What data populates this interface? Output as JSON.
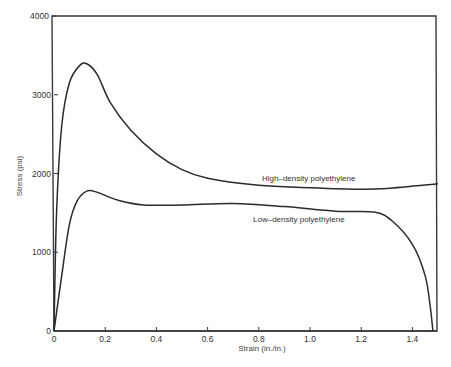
{
  "chart_data": {
    "type": "line",
    "title": "",
    "xlabel": "Strain (in./in.)",
    "ylabel": "Stress (psi)",
    "xlim": [
      0,
      1.5
    ],
    "ylim": [
      0,
      4000
    ],
    "grid": false,
    "legend": "inline annotations",
    "x_ticks": [
      0,
      0.2,
      0.4,
      0.6,
      0.8,
      1.0,
      1.2,
      1.4
    ],
    "x_tick_labels": [
      "0",
      "0.2",
      "0.4",
      "0.6",
      "0.8",
      "1.0",
      "1.2",
      "1.4"
    ],
    "y_ticks": [
      0,
      1000,
      2000,
      3000,
      4000
    ],
    "y_tick_labels": [
      "0",
      "1000",
      "2000",
      "3000",
      "4000"
    ],
    "series": [
      {
        "name": "High–density polyethylene",
        "x": [
          0,
          0.01,
          0.03,
          0.06,
          0.1,
          0.13,
          0.17,
          0.22,
          0.3,
          0.4,
          0.5,
          0.6,
          0.8,
          1.0,
          1.2,
          1.3,
          1.5
        ],
        "y": [
          0,
          1500,
          2600,
          3150,
          3370,
          3390,
          3250,
          2900,
          2550,
          2250,
          2050,
          1940,
          1850,
          1820,
          1800,
          1810,
          1870
        ]
      },
      {
        "name": "Low–density polyethylene",
        "x": [
          0,
          0.03,
          0.06,
          0.09,
          0.13,
          0.17,
          0.25,
          0.35,
          0.5,
          0.7,
          0.9,
          1.1,
          1.25,
          1.32,
          1.4,
          1.45,
          1.47,
          1.48
        ],
        "y": [
          0,
          700,
          1350,
          1650,
          1780,
          1760,
          1660,
          1600,
          1600,
          1620,
          1580,
          1520,
          1510,
          1400,
          1100,
          700,
          300,
          0
        ]
      }
    ],
    "annotations": [
      {
        "text": "High–density polyethylene",
        "x": 0.9,
        "y": 1950
      },
      {
        "text": "Low–density polyethylene",
        "x": 0.78,
        "y": 1390
      }
    ]
  },
  "labels": {
    "xlabel": "Strain (in./in.)",
    "ylabel": "Stress (psi)",
    "high_density": "High–density polyethylene",
    "low_density": "Low–density polyethylene"
  },
  "style": {
    "line_color": "#2b2b2b",
    "axis_color": "#3a3a3a"
  }
}
